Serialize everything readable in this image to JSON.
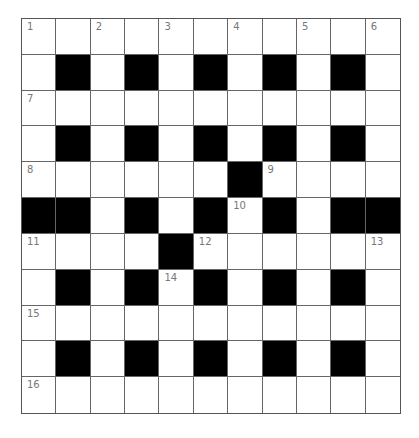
{
  "puzzle": {
    "rows": 11,
    "cols": 11,
    "colors": {
      "black_cell": "#000000",
      "white_cell": "#ffffff",
      "grid_line": "#666666",
      "number": "#777777"
    },
    "grid": [
      [
        0,
        0,
        0,
        0,
        0,
        0,
        0,
        0,
        0,
        0,
        0
      ],
      [
        0,
        1,
        0,
        1,
        0,
        1,
        0,
        1,
        0,
        1,
        0
      ],
      [
        0,
        0,
        0,
        0,
        0,
        0,
        0,
        0,
        0,
        0,
        0
      ],
      [
        0,
        1,
        0,
        1,
        0,
        1,
        0,
        1,
        0,
        1,
        0
      ],
      [
        0,
        0,
        0,
        0,
        0,
        0,
        1,
        0,
        0,
        0,
        0
      ],
      [
        1,
        1,
        0,
        1,
        0,
        1,
        0,
        1,
        0,
        1,
        1
      ],
      [
        0,
        0,
        0,
        0,
        1,
        0,
        0,
        0,
        0,
        0,
        0
      ],
      [
        0,
        1,
        0,
        1,
        0,
        1,
        0,
        1,
        0,
        1,
        0
      ],
      [
        0,
        0,
        0,
        0,
        0,
        0,
        0,
        0,
        0,
        0,
        0
      ],
      [
        0,
        1,
        0,
        1,
        0,
        1,
        0,
        1,
        0,
        1,
        0
      ],
      [
        0,
        0,
        0,
        0,
        0,
        0,
        0,
        0,
        0,
        0,
        0
      ]
    ],
    "numbers": [
      {
        "row": 0,
        "col": 0,
        "label": "1"
      },
      {
        "row": 0,
        "col": 2,
        "label": "2"
      },
      {
        "row": 0,
        "col": 4,
        "label": "3"
      },
      {
        "row": 0,
        "col": 6,
        "label": "4"
      },
      {
        "row": 0,
        "col": 8,
        "label": "5"
      },
      {
        "row": 0,
        "col": 10,
        "label": "6"
      },
      {
        "row": 2,
        "col": 0,
        "label": "7"
      },
      {
        "row": 4,
        "col": 0,
        "label": "8"
      },
      {
        "row": 4,
        "col": 7,
        "label": "9"
      },
      {
        "row": 5,
        "col": 6,
        "label": "10"
      },
      {
        "row": 6,
        "col": 0,
        "label": "11"
      },
      {
        "row": 6,
        "col": 5,
        "label": "12"
      },
      {
        "row": 6,
        "col": 10,
        "label": "13"
      },
      {
        "row": 7,
        "col": 4,
        "label": "14"
      },
      {
        "row": 8,
        "col": 0,
        "label": "15"
      },
      {
        "row": 10,
        "col": 0,
        "label": "16"
      }
    ]
  }
}
